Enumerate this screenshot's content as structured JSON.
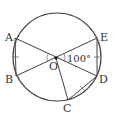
{
  "diagram": {
    "type": "geometry",
    "points": {
      "A": {
        "label": "A",
        "x": 15,
        "y": 38
      },
      "B": {
        "label": "B",
        "x": 16,
        "y": 76
      },
      "C": {
        "label": "C",
        "x": 68,
        "y": 100
      },
      "D": {
        "label": "D",
        "x": 97,
        "y": 76
      },
      "E": {
        "label": "E",
        "x": 97,
        "y": 38
      },
      "O": {
        "label": "O",
        "x": 56,
        "y": 58
      }
    },
    "circle": {
      "cx": 57,
      "cy": 57,
      "r": 44
    },
    "angle_label": "100°",
    "equal_marks": [
      "AB",
      "ED",
      "CD"
    ],
    "stroke_color": "#444444"
  }
}
